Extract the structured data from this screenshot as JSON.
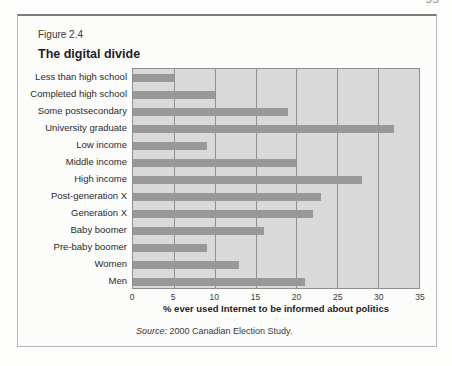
{
  "page": {
    "number": "55"
  },
  "figure": {
    "label": "Figure 2.4",
    "title": "The digital divide",
    "source_prefix": "Source:",
    "source_text": " 2000 Canadian Election Study."
  },
  "chart_data": {
    "type": "bar",
    "orientation": "horizontal",
    "title": "The digital divide",
    "categories": [
      "Less than high school",
      "Completed high school",
      "Some postsecondary",
      "University graduate",
      "Low income",
      "Middle income",
      "High income",
      "Post-generation X",
      "Generation X",
      "Baby boomer",
      "Pre-baby boomer",
      "Women",
      "Men"
    ],
    "values": [
      5,
      10,
      19,
      32,
      9,
      20,
      28,
      23,
      22,
      16,
      9,
      13,
      21
    ],
    "xlabel": "% ever used Internet to be informed about politics",
    "xlim": [
      0,
      35
    ],
    "xticks": [
      0,
      5,
      10,
      15,
      20,
      25,
      30,
      35
    ],
    "grid": true,
    "legend": false,
    "bar_color": "#989898",
    "plot_bg": "#d9d9d9",
    "gridline_color": "#909090"
  }
}
